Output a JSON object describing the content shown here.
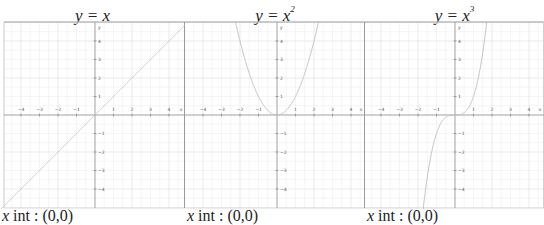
{
  "chart_data": [
    {
      "type": "line",
      "title": "y = x",
      "function": "x",
      "x_range": [
        -4.9,
        4.9
      ],
      "y_range": [
        -5,
        5
      ],
      "x_ticks": [
        -4,
        -3,
        -2,
        -1,
        1,
        2,
        3,
        4
      ],
      "y_ticks": [
        -4,
        -3,
        -2,
        -1,
        1,
        2,
        3,
        4
      ],
      "xlabel": "x",
      "ylabel": "y",
      "grid": true,
      "caption": "x int : (0,0)",
      "line_color": "#c8c8c8",
      "points": [
        [
          -4.9,
          -4.9
        ],
        [
          0,
          0
        ],
        [
          4.9,
          4.9
        ]
      ]
    },
    {
      "type": "line",
      "title": "y = x^2",
      "function": "x^2",
      "x_range": [
        -4.9,
        4.9
      ],
      "y_range": [
        -5,
        5
      ],
      "x_ticks": [
        -4,
        -3,
        -2,
        -1,
        1,
        2,
        3,
        4
      ],
      "y_ticks": [
        -4,
        -3,
        -2,
        -1,
        1,
        2,
        3,
        4
      ],
      "xlabel": "x",
      "ylabel": "y",
      "grid": true,
      "caption": "x int : (0,0)",
      "line_color": "#c8c8c8",
      "points": [
        [
          -2.2,
          4.84
        ],
        [
          -2,
          4
        ],
        [
          -1,
          1
        ],
        [
          0,
          0
        ],
        [
          1,
          1
        ],
        [
          2,
          4
        ],
        [
          2.2,
          4.84
        ]
      ]
    },
    {
      "type": "line",
      "title": "y = x^3",
      "function": "x^3",
      "x_range": [
        -4.9,
        4.9
      ],
      "y_range": [
        -5,
        5
      ],
      "x_ticks": [
        -4,
        -3,
        -2,
        -1,
        1,
        2,
        3,
        4
      ],
      "y_ticks": [
        -4,
        -3,
        -2,
        -1,
        1,
        2,
        3,
        4
      ],
      "xlabel": "x",
      "ylabel": "y",
      "grid": true,
      "caption": "x int : (0,0)",
      "line_color": "#c8c8c8",
      "points": [
        [
          -1.7,
          -4.91
        ],
        [
          -1,
          -1
        ],
        [
          0,
          0
        ],
        [
          1,
          1
        ],
        [
          1.7,
          4.91
        ]
      ]
    }
  ],
  "panels": [
    {
      "title_base": "y = x",
      "title_exp": "",
      "caption_var": "x",
      "caption_rest": " int : (0,0)"
    },
    {
      "title_base": "y = x",
      "title_exp": "2",
      "caption_var": "x",
      "caption_rest": " int : (0,0)"
    },
    {
      "title_base": "y = x",
      "title_exp": "3",
      "caption_var": "x",
      "caption_rest": " int : (0,0)"
    }
  ],
  "colors": {
    "grid_major": "#dcdcdc",
    "grid_minor": "#efefef",
    "axis": "#9a9a9a",
    "frame": "#9a9a9a",
    "curve": "#c4c4c4"
  }
}
